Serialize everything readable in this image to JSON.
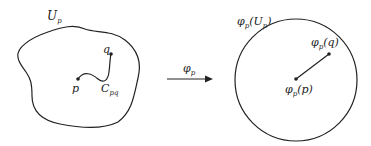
{
  "diagram": {
    "left_region": {
      "label": "U",
      "label_sub": "p",
      "point_p": "p",
      "point_q": "q",
      "curve_label": "C",
      "curve_label_sub": "pq"
    },
    "map": {
      "label": "φ",
      "label_sub": "p"
    },
    "right_region": {
      "label": "φ",
      "label_sub": "p",
      "label_arg": "(U",
      "label_arg_sub": "p",
      "label_close": ")",
      "image_q": "φ",
      "image_q_sub": "p",
      "image_q_arg": "(q)",
      "image_p": "φ",
      "image_p_sub": "p",
      "image_p_arg": "(p)"
    },
    "colors": {
      "stroke": "#222222",
      "background": "#ffffff"
    }
  }
}
